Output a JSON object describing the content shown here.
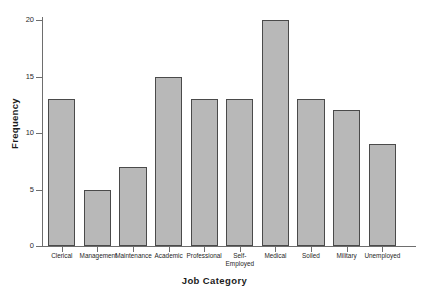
{
  "chart_data": {
    "type": "bar",
    "title": "",
    "xlabel": "Job Category",
    "ylabel": "Frequency",
    "categories": [
      "Clerical",
      "Management",
      "Maintenance",
      "Academic",
      "Professional",
      "Self-\nEmployed",
      "Medical",
      "Soiled",
      "Military",
      "Unemployed"
    ],
    "values": [
      13,
      5,
      7,
      15,
      13,
      13,
      20,
      13,
      12,
      9
    ],
    "ylim": [
      0,
      20
    ],
    "yticks": [
      0,
      5,
      10,
      15,
      20
    ],
    "ytick_labels": [
      "0",
      "5",
      "10",
      "15",
      "20"
    ],
    "grid": false,
    "legend": false,
    "bar_color": "#b8b8b8",
    "bar_edge_color": "#4a4a4a",
    "axis_color": "#6e6e6e",
    "background_color": "#ffffff"
  }
}
